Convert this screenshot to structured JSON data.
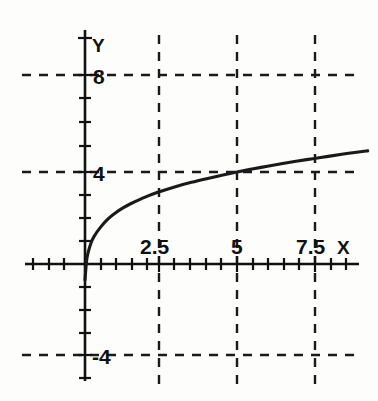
{
  "chart_data": {
    "type": "line",
    "title": "",
    "subtitle": "",
    "xlabel": "X",
    "ylabel": "Y",
    "xlim": [
      -2,
      9.5
    ],
    "ylim": [
      -5.2,
      9.4
    ],
    "grid": true,
    "legend": null,
    "x_ticks_major": [
      2.5,
      5,
      7.5
    ],
    "x_tick_labels": [
      "2.5",
      "5",
      "7.5"
    ],
    "y_ticks_major": [
      8,
      4,
      -4
    ],
    "y_tick_labels": [
      "8",
      "4",
      "-4"
    ],
    "x_minor_tick_step": 0.5,
    "y_minor_tick_step": 1,
    "curve_description": "increasing concave-down square-root curve",
    "curve_equation": "y = 4*sqrt(x/5) - 0.7 (approx)",
    "series": [
      {
        "name": "curve",
        "color": "#1a1a1a",
        "x": [
          0,
          0.05,
          0.1,
          0.2,
          0.3,
          0.5,
          0.75,
          1,
          1.25,
          1.5,
          2,
          2.5,
          3,
          3.5,
          4,
          4.5,
          5,
          5.5,
          6,
          6.5,
          7,
          7.5,
          8,
          8.5,
          9,
          9.3
        ],
        "y": [
          -0.7,
          0.12,
          0.48,
          0.92,
          1.2,
          1.58,
          1.95,
          2.22,
          2.44,
          2.62,
          2.92,
          3.16,
          3.37,
          3.55,
          3.71,
          3.86,
          4.0,
          4.13,
          4.25,
          4.37,
          4.48,
          4.58,
          4.68,
          4.78,
          4.87,
          4.92
        ]
      }
    ],
    "key_points": [
      {
        "x": 0,
        "y": -0.7,
        "note": "curve start, just below origin"
      },
      {
        "x": 2.5,
        "y": 2.8,
        "note": "crosses x=2.5 gridline"
      },
      {
        "x": 5,
        "y": 4.0,
        "note": "crosses intersection of x=5 and y=4 gridlines"
      },
      {
        "x": 7.5,
        "y": 4.6,
        "note": "crosses x=7.5 gridline"
      },
      {
        "x": 9.3,
        "y": 4.92,
        "note": "right end of curve"
      }
    ]
  },
  "axes": {
    "x_axis_name": "x-axis",
    "y_axis_name": "y-axis",
    "x_label": "X",
    "y_label": "Y"
  },
  "tick_labels": {
    "x": [
      {
        "value": 2.5,
        "text": "2.5"
      },
      {
        "value": 5,
        "text": "5"
      },
      {
        "value": 7.5,
        "text": "7.5"
      }
    ],
    "y": [
      {
        "value": 8,
        "text": "8"
      },
      {
        "value": 4,
        "text": "4"
      },
      {
        "value": -4,
        "text": "-4"
      }
    ]
  },
  "style": {
    "background": "#fdfdfc",
    "axis_color": "#111111",
    "grid_color": "#1a1a1a",
    "curve_color": "#1a1a1a"
  }
}
